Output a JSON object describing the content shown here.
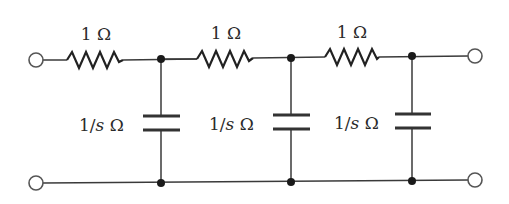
{
  "diagram": {
    "type": "RC ladder network (3 sections)",
    "colors": {
      "line": "#3a3a3a",
      "background": "#ffffff"
    },
    "resistors": [
      {
        "label": "1 Ω",
        "value": "1",
        "unit": "Ω"
      },
      {
        "label": "1 Ω",
        "value": "1",
        "unit": "Ω"
      },
      {
        "label": "1 Ω",
        "value": "1",
        "unit": "Ω"
      }
    ],
    "capacitors": [
      {
        "label_num": "1/",
        "label_var": "s",
        "label_unit": " Ω"
      },
      {
        "label_num": "1/",
        "label_var": "s",
        "label_unit": " Ω"
      },
      {
        "label_num": "1/",
        "label_var": "s",
        "label_unit": " Ω"
      }
    ],
    "terminals": [
      "input-top",
      "input-bottom",
      "output-top",
      "output-bottom"
    ]
  }
}
